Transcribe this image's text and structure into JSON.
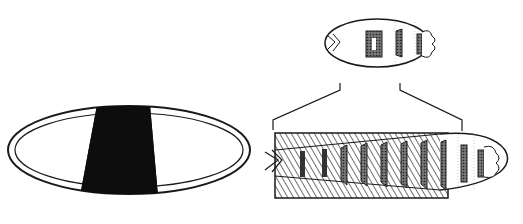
{
  "figure": {
    "width": 523,
    "height": 224,
    "background": "#ffffff",
    "ink_color": "#1a1a1a",
    "panels": [
      {
        "id": "embryo",
        "description": "oval embryo outline with central dark band"
      },
      {
        "id": "larva-small",
        "description": "small larva with three segment denticle bands"
      },
      {
        "id": "larva-enlarged",
        "description": "enlarged larva with hatched overlay region and repeated denticle bands"
      }
    ],
    "larva_enlarged": {
      "band_count": 10,
      "hatched_region": true
    }
  }
}
